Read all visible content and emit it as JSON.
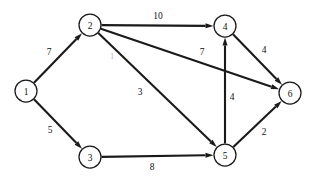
{
  "figure": {
    "type": "weighted-directed-graph",
    "background_color": "#ffffff",
    "ink_color": "#1a1a1a",
    "width": 314,
    "height": 178
  },
  "nodes": [
    {
      "id": "1",
      "label": "1",
      "x": 26,
      "y": 91,
      "r": 11
    },
    {
      "id": "2",
      "label": "2",
      "x": 90,
      "y": 25,
      "r": 11
    },
    {
      "id": "3",
      "label": "3",
      "x": 90,
      "y": 157,
      "r": 11
    },
    {
      "id": "4",
      "label": "4",
      "x": 225,
      "y": 26,
      "r": 11
    },
    {
      "id": "5",
      "label": "5",
      "x": 225,
      "y": 155,
      "r": 11
    },
    {
      "id": "6",
      "label": "6",
      "x": 290,
      "y": 93,
      "r": 11
    }
  ],
  "edges": [
    {
      "id": "e-1-2",
      "from": "1",
      "to": "2",
      "weight": "7",
      "label_x": 49,
      "label_y": 52,
      "faint": false
    },
    {
      "id": "e-1-3",
      "from": "1",
      "to": "3",
      "weight": "5",
      "label_x": 50,
      "label_y": 130,
      "faint": false
    },
    {
      "id": "e-2-4",
      "from": "2",
      "to": "4",
      "weight": "10",
      "label_x": 158,
      "label_y": 16,
      "faint": false
    },
    {
      "id": "e-2-6",
      "from": "2",
      "to": "6",
      "weight": "7",
      "label_x": 202,
      "label_y": 52,
      "faint": false
    },
    {
      "id": "e-2-5",
      "from": "2",
      "to": "5",
      "weight": "3",
      "label_x": 140,
      "label_y": 92,
      "faint": false
    },
    {
      "id": "e-2-5b",
      "from": "2",
      "to": "5",
      "weight": "1",
      "label_x": 112,
      "label_y": 56,
      "faint": true
    },
    {
      "id": "e-3-5",
      "from": "3",
      "to": "5",
      "weight": "8",
      "label_x": 152,
      "label_y": 167,
      "faint": false
    },
    {
      "id": "e-4-6",
      "from": "4",
      "to": "6",
      "weight": "4",
      "label_x": 264,
      "label_y": 50,
      "faint": false
    },
    {
      "id": "e-5-4",
      "from": "5",
      "to": "4",
      "weight": "4",
      "label_x": 232,
      "label_y": 97,
      "faint": false
    },
    {
      "id": "e-5-6",
      "from": "5",
      "to": "6",
      "weight": "2",
      "label_x": 264,
      "label_y": 132,
      "faint": false
    }
  ]
}
